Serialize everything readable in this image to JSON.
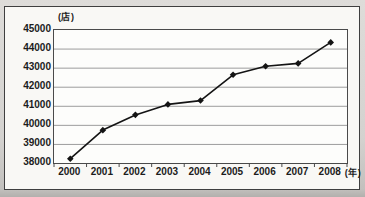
{
  "chart": {
    "y_unit": "(店)",
    "x_unit": "(年)",
    "colors": {
      "line": "#141414",
      "marker": "#141414",
      "grid": "#9c9c9c",
      "axis": "#4a4a4a",
      "box_bg": "#f9f8f5",
      "box_border": "#3f3f3f",
      "text": "#1c1c1c"
    }
  },
  "chart_data": {
    "type": "line",
    "title": "",
    "categories": [
      "2000",
      "2001",
      "2002",
      "2003",
      "2004",
      "2005",
      "2006",
      "2007",
      "2008"
    ],
    "values": [
      38250,
      39750,
      40550,
      41100,
      41300,
      42650,
      43100,
      43250,
      44350
    ],
    "xlabel": "(年)",
    "ylabel": "(店)",
    "ylim": [
      38000,
      45000
    ],
    "ytick_step": 1000,
    "yticks": [
      45000,
      44000,
      43000,
      42000,
      41000,
      40000,
      39000,
      38000
    ],
    "grid": true,
    "legend": false,
    "marker": "diamond"
  }
}
